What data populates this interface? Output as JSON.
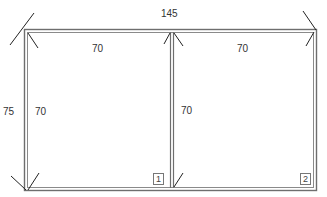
{
  "diagram": {
    "type": "window-frame-dimension-drawing",
    "overall_width_label": "145",
    "overall_height_label": "75",
    "panels": [
      {
        "id": "1",
        "width_label": "70",
        "height_label": "70"
      },
      {
        "id": "2",
        "width_label": "70",
        "height_label": "70"
      }
    ],
    "colors": {
      "frame_line": "#6e6e6e",
      "text": "#333333",
      "background": "#ffffff"
    }
  }
}
